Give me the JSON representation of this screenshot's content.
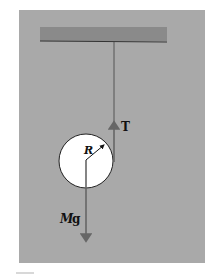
{
  "figure": {
    "background_color": "#a9a9a9",
    "bar_color": "#8a8a8a",
    "labels": {
      "tension": "T",
      "radius": "R",
      "weight_mass": "M",
      "weight_g": "g"
    },
    "elements": {
      "ceiling_bar": "ceiling-bar",
      "string": "string",
      "disk": "disk",
      "tension_arrow": "tension-arrow",
      "weight_arrow": "weight-arrow",
      "radius_arrow": "radius-arrow"
    }
  }
}
